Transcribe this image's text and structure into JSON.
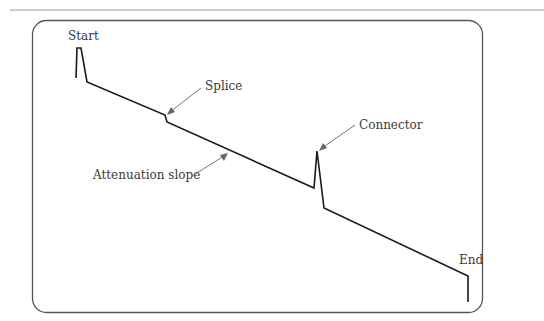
{
  "diagram": {
    "colors": {
      "rule": "#9a9a9a",
      "frame": "#555555",
      "trace": "#1a1a1a",
      "arrow": "#666666",
      "text": "#3a3a3a"
    },
    "labels": {
      "start": "Start",
      "splice": "Splice",
      "connector": "Connector",
      "attenuation": "Attenuation slope",
      "end": "End"
    },
    "trace_points": [
      [
        76,
        78
      ],
      [
        77,
        48
      ],
      [
        81,
        48
      ],
      [
        87,
        82
      ],
      [
        165,
        115
      ],
      [
        167,
        122
      ],
      [
        314,
        188
      ],
      [
        317,
        151
      ],
      [
        324,
        208
      ],
      [
        468,
        276
      ],
      [
        468,
        302
      ]
    ]
  }
}
